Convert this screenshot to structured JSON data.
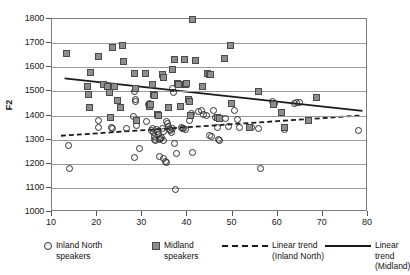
{
  "chart_data": {
    "type": "scatter",
    "title": "",
    "xlabel": "",
    "ylabel": "F2",
    "xlim": [
      10,
      80
    ],
    "ylim": [
      1000,
      1800
    ],
    "xticks": [
      10,
      20,
      30,
      40,
      50,
      60,
      70,
      80
    ],
    "yticks": [
      1000,
      1100,
      1200,
      1300,
      1400,
      1500,
      1600,
      1700,
      1800
    ],
    "grid": "horizontal",
    "legend_position": "bottom",
    "series": [
      {
        "name": "Inland North speakers",
        "marker": "open-circle",
        "color": "#2f2f2f",
        "points": [
          [
            13.6,
            1275
          ],
          [
            13.8,
            1181
          ],
          [
            20.2,
            1381
          ],
          [
            20.4,
            1351
          ],
          [
            23.1,
            1349
          ],
          [
            23.4,
            1345
          ],
          [
            26.6,
            1347
          ],
          [
            28.0,
            1394
          ],
          [
            28.2,
            1501
          ],
          [
            28.4,
            1467
          ],
          [
            28.6,
            1456
          ],
          [
            28.8,
            1357
          ],
          [
            28.3,
            1225
          ],
          [
            29.4,
            1263
          ],
          [
            30.9,
            1376
          ],
          [
            31.4,
            1447
          ],
          [
            31.6,
            1451
          ],
          [
            31.8,
            1441
          ],
          [
            32.0,
            1338
          ],
          [
            32.2,
            1345
          ],
          [
            32.4,
            1329
          ],
          [
            32.6,
            1311
          ],
          [
            32.8,
            1302
          ],
          [
            33.0,
            1297
          ],
          [
            33.2,
            1340
          ],
          [
            33.4,
            1334
          ],
          [
            33.6,
            1321
          ],
          [
            33.8,
            1299
          ],
          [
            34.0,
            1303
          ],
          [
            34.2,
            1310
          ],
          [
            34.4,
            1347
          ],
          [
            34.6,
            1332
          ],
          [
            34.8,
            1297
          ],
          [
            33.9,
            1231
          ],
          [
            34.6,
            1222
          ],
          [
            35.1,
            1211
          ],
          [
            35.3,
            1207
          ],
          [
            35.4,
            1375
          ],
          [
            35.6,
            1368
          ],
          [
            35.8,
            1356
          ],
          [
            36.0,
            1344
          ],
          [
            36.2,
            1336
          ],
          [
            36.4,
            1328
          ],
          [
            36.6,
            1347
          ],
          [
            36.8,
            1513
          ],
          [
            37.0,
            1494
          ],
          [
            37.2,
            1283
          ],
          [
            37.4,
            1093
          ],
          [
            37.6,
            1241
          ],
          [
            38.6,
            1352
          ],
          [
            38.8,
            1346
          ],
          [
            39.2,
            1348
          ],
          [
            39.6,
            1343
          ],
          [
            40.4,
            1379
          ],
          [
            40.8,
            1410
          ],
          [
            41.2,
            1247
          ],
          [
            42.4,
            1416
          ],
          [
            43.2,
            1422
          ],
          [
            43.6,
            1406
          ],
          [
            44.2,
            1398
          ],
          [
            44.8,
            1319
          ],
          [
            45.4,
            1313
          ],
          [
            45.8,
            1419
          ],
          [
            46.2,
            1390
          ],
          [
            46.6,
            1352
          ],
          [
            46.8,
            1302
          ],
          [
            47.2,
            1297
          ],
          [
            48.4,
            1386
          ],
          [
            49.2,
            1354
          ],
          [
            50.4,
            1419
          ],
          [
            51.2,
            1383
          ],
          [
            51.6,
            1352
          ],
          [
            53.8,
            1352
          ],
          [
            54.2,
            1349
          ],
          [
            55.8,
            1348
          ],
          [
            56.2,
            1182
          ],
          [
            58.8,
            1457
          ],
          [
            59.2,
            1451
          ],
          [
            61.4,
            1343
          ],
          [
            63.8,
            1449
          ],
          [
            64.2,
            1452
          ],
          [
            64.8,
            1453
          ],
          [
            66.8,
            1379
          ],
          [
            77.8,
            1338
          ]
        ]
      },
      {
        "name": "Midland speakers",
        "marker": "filled-square",
        "color": "#8d8d8d",
        "points": [
          [
            13.2,
            1655
          ],
          [
            17.8,
            1519
          ],
          [
            18.0,
            1489
          ],
          [
            18.2,
            1434
          ],
          [
            18.6,
            1578
          ],
          [
            20.2,
            1646
          ],
          [
            21.4,
            1527
          ],
          [
            22.4,
            1520
          ],
          [
            22.8,
            1497
          ],
          [
            23.0,
            1390
          ],
          [
            23.4,
            1680
          ],
          [
            23.8,
            1519
          ],
          [
            24.6,
            1461
          ],
          [
            25.2,
            1433
          ],
          [
            25.6,
            1691
          ],
          [
            25.8,
            1622
          ],
          [
            28.2,
            1575
          ],
          [
            28.4,
            1513
          ],
          [
            28.8,
            1379
          ],
          [
            30.8,
            1575
          ],
          [
            31.6,
            1437
          ],
          [
            31.8,
            1446
          ],
          [
            32.2,
            1528
          ],
          [
            32.4,
            1489
          ],
          [
            32.6,
            1484
          ],
          [
            33.4,
            1404
          ],
          [
            33.6,
            1398
          ],
          [
            34.4,
            1572
          ],
          [
            34.8,
            1557
          ],
          [
            35.8,
            1434
          ],
          [
            36.6,
            1591
          ],
          [
            37.2,
            1634
          ],
          [
            37.8,
            1531
          ],
          [
            38.0,
            1528
          ],
          [
            38.4,
            1436
          ],
          [
            39.4,
            1632
          ],
          [
            39.6,
            1528
          ],
          [
            39.8,
            1531
          ],
          [
            40.2,
            1466
          ],
          [
            40.4,
            1459
          ],
          [
            40.6,
            1400
          ],
          [
            41.2,
            1800
          ],
          [
            41.8,
            1626
          ],
          [
            43.4,
            1519
          ],
          [
            44.4,
            1573
          ],
          [
            44.8,
            1572
          ],
          [
            45.2,
            1572
          ],
          [
            46.6,
            1391
          ],
          [
            47.0,
            1388
          ],
          [
            48.2,
            1636
          ],
          [
            49.6,
            1691
          ],
          [
            49.8,
            1451
          ],
          [
            53.8,
            1352
          ],
          [
            55.8,
            1499
          ],
          [
            59.0,
            1445
          ],
          [
            60.8,
            1411
          ],
          [
            61.4,
            1352
          ],
          [
            66.8,
            1379
          ],
          [
            68.6,
            1473
          ]
        ]
      }
    ],
    "trends": [
      {
        "name": "Linear trend (Inland North)",
        "style": "dashed",
        "color": "#1a1a1a",
        "x0": 12.0,
        "y0": 1311,
        "x1": 79.0,
        "y1": 1396
      },
      {
        "name": "Linear trend (Midland)",
        "style": "solid",
        "color": "#1a1a1a",
        "x0": 12.8,
        "y0": 1551,
        "x1": 79.2,
        "y1": 1415
      }
    ]
  },
  "legend": {
    "items": [
      {
        "label": "Inland North\nspeakers",
        "swatch": "open-circle-swatch"
      },
      {
        "label": "Midland\nspeakers",
        "swatch": "filled-square-swatch"
      },
      {
        "label": "Linear trend\n(Inland North)",
        "swatch": "dashed-line-swatch"
      },
      {
        "label": "Linear trend\n(Midland)",
        "swatch": "solid-line-swatch"
      }
    ]
  }
}
